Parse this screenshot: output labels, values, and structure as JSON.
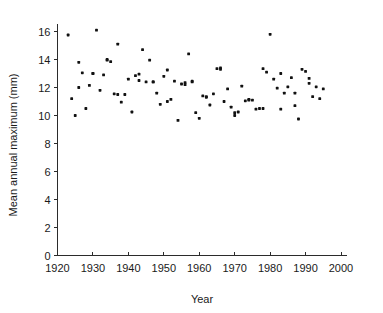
{
  "chart_data": {
    "type": "scatter",
    "title": "",
    "xlabel": "Year",
    "ylabel": "Mean annual maximum (mm)",
    "xlim": [
      1920,
      2000
    ],
    "ylim": [
      0,
      16.8
    ],
    "xticks": [
      1920,
      1930,
      1940,
      1950,
      1960,
      1970,
      1980,
      1990,
      2000
    ],
    "xtick_labels": [
      "1920",
      "1930",
      "1940",
      "1950",
      "1960",
      "1970",
      "1980",
      "1990",
      "2000"
    ],
    "yticks": [
      0,
      2,
      4,
      6,
      8,
      10,
      12,
      14,
      16
    ],
    "ytick_labels": [
      "0",
      "2",
      "4",
      "6",
      "8",
      "10",
      "12",
      "14",
      "16"
    ],
    "grid": false,
    "legend": "none",
    "marker": "filled-square-dot",
    "marker_color": "#111111",
    "n_points": 90,
    "series": [
      {
        "name": "Mean annual maximum",
        "x": [
          1923,
          1924,
          1925,
          1926,
          1927,
          1928,
          1929,
          1930,
          1931,
          1932,
          1933,
          1934,
          1935,
          1936,
          1937,
          1938,
          1939,
          1940,
          1941,
          1942,
          1943,
          1944,
          1945,
          1946,
          1947,
          1948,
          1949,
          1950,
          1951,
          1952,
          1953,
          1954,
          1955,
          1956,
          1957,
          1958,
          1959,
          1960,
          1961,
          1962,
          1963,
          1964,
          1965,
          1966,
          1967,
          1968,
          1969,
          1970,
          1971,
          1972,
          1973,
          1974,
          1975,
          1976,
          1977,
          1978,
          1979,
          1980,
          1981,
          1982,
          1983,
          1984,
          1985,
          1986,
          1987,
          1988,
          1989,
          1990,
          1991,
          1992,
          1993,
          1994,
          1995,
          1926,
          1930,
          1934,
          1937,
          1943,
          1947,
          1951,
          1956,
          1958,
          1962,
          1966,
          1970,
          1974,
          1978,
          1983,
          1987,
          1991
        ],
        "y": [
          15.75,
          11.2,
          10.0,
          13.8,
          13.05,
          10.5,
          12.15,
          13.0,
          16.1,
          11.8,
          12.9,
          13.95,
          13.85,
          11.55,
          15.1,
          10.95,
          11.5,
          12.6,
          10.25,
          12.85,
          12.95,
          14.7,
          12.4,
          13.95,
          12.4,
          11.6,
          10.8,
          12.8,
          13.25,
          11.15,
          12.45,
          9.65,
          12.25,
          12.35,
          14.4,
          12.45,
          10.2,
          9.8,
          11.4,
          11.3,
          10.75,
          11.55,
          13.35,
          13.4,
          11.0,
          11.9,
          10.6,
          10.0,
          10.25,
          12.1,
          11.05,
          11.15,
          11.1,
          10.45,
          10.5,
          13.35,
          13.1,
          15.8,
          12.6,
          11.95,
          10.45,
          11.6,
          12.05,
          12.7,
          10.7,
          9.75,
          13.3,
          13.15,
          12.3,
          11.35,
          12.05,
          11.2,
          11.9,
          12.0,
          13.0,
          14.0,
          11.5,
          12.5,
          12.4,
          11.0,
          12.2,
          12.4,
          11.35,
          13.3,
          10.2,
          11.1,
          10.5,
          13.0,
          11.6,
          12.65
        ]
      }
    ]
  },
  "axes": {
    "y_axis_label": "Mean annual maximum (mm)",
    "x_axis_label": "Year"
  }
}
